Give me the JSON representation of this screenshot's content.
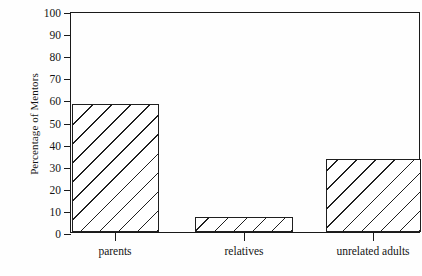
{
  "chart_data": {
    "type": "bar",
    "title": "",
    "xlabel": "",
    "ylabel": "Percentage of Mentors",
    "categories": [
      "parents",
      "relatives",
      "unrelated adults"
    ],
    "values": [
      58,
      7,
      33
    ],
    "ylim": [
      0,
      100
    ],
    "yticks": [
      0,
      10,
      20,
      30,
      40,
      50,
      60,
      70,
      80,
      90,
      100
    ],
    "ytick_labels": [
      "0",
      "10",
      "20",
      "30",
      "40",
      "50",
      "60",
      "70",
      "80",
      "90",
      "100"
    ],
    "grid": false,
    "legend": null,
    "bar_style": "diagonal-hatch",
    "frame": "box",
    "colors": {
      "axis": "#1a1a1a",
      "bar_edge": "#1f1f1f",
      "bar_fill": "#ffffff",
      "hatch": "#1f1f1f",
      "background": "#fefefe",
      "text": "#141414"
    }
  }
}
